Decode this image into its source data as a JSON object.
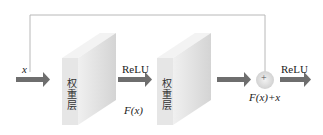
{
  "diagram": {
    "input_label": "x",
    "layer1": {
      "label": "权重层"
    },
    "activation1": "ReLU",
    "intermediate_label": "F(x)",
    "layer2": {
      "label": "权重层"
    },
    "sum_node": {
      "symbol": "+",
      "label": "F(x)+x"
    },
    "activation2": "ReLU",
    "colors": {
      "arrow": "#6e6e6e",
      "block_front": "#e8e8e8",
      "block_side": "#d6d6d6",
      "block_top": "#f2f2f2",
      "skip_line": "#b8b8b8",
      "sum_node": "#e0e0e0"
    }
  }
}
